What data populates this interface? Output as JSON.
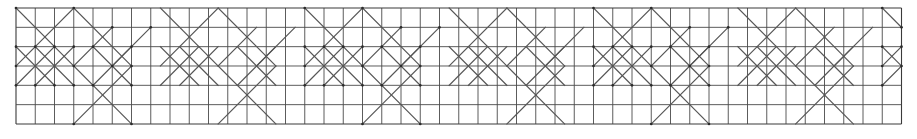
{
  "figure": {
    "type": "geometric-lattice-diagram",
    "caption": "",
    "background_color": "#ffffff"
  },
  "chart_data": {
    "type": "table",
    "xlabel": "",
    "ylabel": "",
    "grid": true,
    "legend": null,
    "geometry": {
      "origin_x": 16,
      "origin_y": 8,
      "cell_width": 19.25,
      "cell_height": 19.33,
      "columns": 46,
      "rows": 6,
      "width_px": 885,
      "height_px": 116,
      "period_columns": 7.5
    },
    "colors": {
      "grid": "#4a4a4a",
      "border": "#3a3a3a",
      "diagonal": "#555555",
      "node": "#2b2b2b",
      "background": "#ffffff"
    },
    "unit_cell_diagonals": [
      {
        "x1": 0,
        "y1": 0,
        "x2": 3,
        "y2": 3
      },
      {
        "x1": 3,
        "y1": 0,
        "x2": 0,
        "y2": 3
      },
      {
        "x1": 3,
        "y1": 0,
        "x2": 6,
        "y2": 3
      },
      {
        "x1": 1,
        "y1": 2,
        "x2": 3,
        "y2": 4
      },
      {
        "x1": 3,
        "y1": 2,
        "x2": 1,
        "y2": 4
      },
      {
        "x1": 0,
        "y1": 2,
        "x2": 2,
        "y2": 4
      },
      {
        "x1": 2,
        "y1": 2,
        "x2": 0,
        "y2": 4
      },
      {
        "x1": 3,
        "y1": 3,
        "x2": 5,
        "y2": 1
      },
      {
        "x1": 3,
        "y1": 3,
        "x2": 6,
        "y2": 6
      },
      {
        "x1": 6,
        "y1": 3,
        "x2": 3,
        "y2": 6
      },
      {
        "x1": 4,
        "y1": 2,
        "x2": 6,
        "y2": 4
      },
      {
        "x1": 6,
        "y1": 2,
        "x2": 4,
        "y2": 4
      },
      {
        "x1": 5,
        "y1": 3,
        "x2": 7,
        "y2": 1
      }
    ],
    "series": [
      {
        "name": "grid-columns",
        "values": [
          0,
          1,
          2,
          3,
          4,
          5,
          6,
          7,
          8,
          9,
          10,
          11,
          12,
          13,
          14,
          15,
          16,
          17,
          18,
          19,
          20,
          21,
          22,
          23,
          24,
          25,
          26,
          27,
          28,
          29,
          30,
          31,
          32,
          33,
          34,
          35,
          36,
          37,
          38,
          39,
          40,
          41,
          42,
          43,
          44,
          45,
          46
        ]
      },
      {
        "name": "grid-rows",
        "values": [
          0,
          1,
          2,
          3,
          4,
          5,
          6
        ]
      }
    ]
  }
}
